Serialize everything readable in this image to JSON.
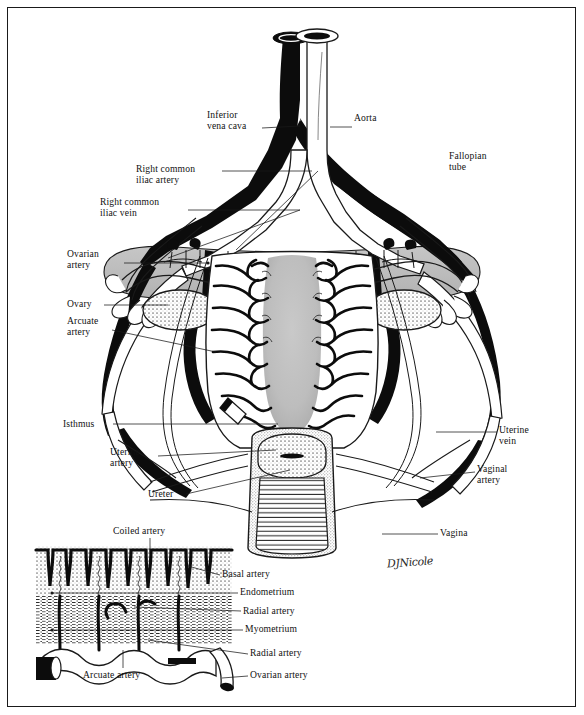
{
  "figure": {
    "signature": "DJNicole",
    "frame_color": "#1a1a1a",
    "background": "#ffffff",
    "ink": "#111111",
    "shade_gray": "#b9b9b9",
    "stipple_gray": "#d8d8d8"
  },
  "main_labels": [
    {
      "id": "inferior-vena-cava",
      "text": "Inferior\nvena cava",
      "x": 207,
      "y": 110,
      "align": "left"
    },
    {
      "id": "aorta",
      "text": "Aorta",
      "x": 354,
      "y": 113,
      "align": "left"
    },
    {
      "id": "right-common-iliac-artery",
      "text": "Right common\niliac artery",
      "x": 136,
      "y": 164,
      "align": "left"
    },
    {
      "id": "fallopian-tube",
      "text": "Fallopian\ntube",
      "x": 449,
      "y": 151,
      "align": "left"
    },
    {
      "id": "right-common-iliac-vein",
      "text": "Right common\niliac vein",
      "x": 100,
      "y": 197,
      "align": "left"
    },
    {
      "id": "ovarian-artery",
      "text": "Ovarian\nartery",
      "x": 67,
      "y": 249,
      "align": "left"
    },
    {
      "id": "ovary",
      "text": "Ovary",
      "x": 67,
      "y": 301,
      "align": "left"
    },
    {
      "id": "arcuate-artery",
      "text": "Arcuate\nartery",
      "x": 67,
      "y": 316,
      "align": "left"
    },
    {
      "id": "isthmus",
      "text": "Isthmus",
      "x": 63,
      "y": 420,
      "align": "left"
    },
    {
      "id": "uterine-vein",
      "text": "Uterine\nvein",
      "x": 499,
      "y": 425,
      "align": "left"
    },
    {
      "id": "uterine-artery",
      "text": "Uterine\nartery",
      "x": 110,
      "y": 447,
      "align": "left"
    },
    {
      "id": "vaginal-artery",
      "text": "Vaginal\nartery",
      "x": 477,
      "y": 464,
      "align": "left"
    },
    {
      "id": "ureter",
      "text": "Ureter",
      "x": 148,
      "y": 490,
      "align": "left"
    },
    {
      "id": "vagina",
      "text": "Vagina",
      "x": 440,
      "y": 529,
      "align": "left"
    }
  ],
  "inset_labels": [
    {
      "id": "coiled-artery",
      "text": "Coiled artery",
      "x": 113,
      "y": 528,
      "align": "left"
    },
    {
      "id": "basal-artery",
      "text": "Basal artery",
      "x": 222,
      "y": 570,
      "align": "left"
    },
    {
      "id": "endometrium",
      "text": "Endometrium",
      "x": 240,
      "y": 589,
      "align": "left"
    },
    {
      "id": "radial-artery-upper",
      "text": "Radial artery",
      "x": 243,
      "y": 607,
      "align": "left"
    },
    {
      "id": "myometrium",
      "text": "Myometrium",
      "x": 245,
      "y": 626,
      "align": "left"
    },
    {
      "id": "radial-artery-lower",
      "text": "Radial artery",
      "x": 250,
      "y": 650,
      "align": "left"
    },
    {
      "id": "arcuate-artery-inset",
      "text": "Arcuate artery",
      "x": 83,
      "y": 672,
      "align": "left"
    },
    {
      "id": "ovarian-artery-inset",
      "text": "Ovarian artery",
      "x": 250,
      "y": 672,
      "align": "left"
    }
  ]
}
